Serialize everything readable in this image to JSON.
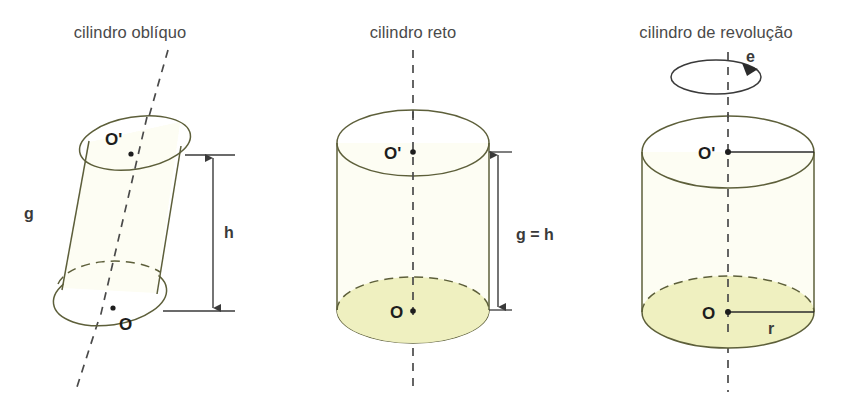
{
  "figure": {
    "kind": "geometry-diagram",
    "background_color": "#ffffff",
    "stroke_color": "#5d5f3a",
    "axis_color": "#4a4a4a",
    "cap_fill_color": "#eff0c0",
    "body_fill_color": "#fdfdf3",
    "label_color": "#1d1d1d",
    "title_color": "#4a4a4a"
  },
  "panels": [
    {
      "id": "cilindro-obliquo",
      "title": "cilindro oblíquo",
      "labels": {
        "top_center": "O'",
        "bottom_center": "O",
        "generatrix": "g",
        "height": "h"
      },
      "has_axis": true,
      "axis_oblique": true,
      "has_height_dimension": true,
      "has_radius": false,
      "has_rotation_arrow": false
    },
    {
      "id": "cilindro-reto",
      "title": "cilindro reto",
      "labels": {
        "top_center": "O'",
        "bottom_center": "O",
        "height": "g = h"
      },
      "has_axis": true,
      "axis_oblique": false,
      "has_height_dimension": true,
      "has_radius": false,
      "has_rotation_arrow": false
    },
    {
      "id": "cilindro-de-revolucao",
      "title": "cilindro de revolução",
      "labels": {
        "top_center": "O'",
        "bottom_center": "O",
        "radius": "r",
        "axis": "e"
      },
      "has_axis": true,
      "axis_oblique": false,
      "has_height_dimension": false,
      "has_radius": true,
      "has_rotation_arrow": true
    }
  ]
}
